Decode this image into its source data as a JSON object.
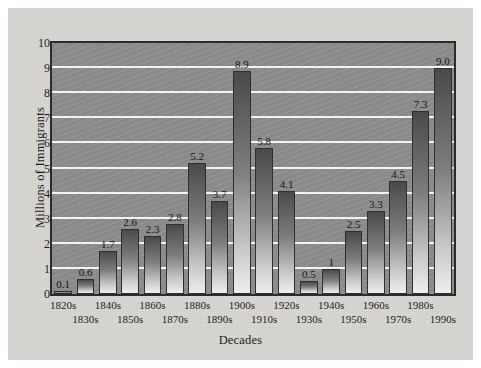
{
  "chart_data": {
    "type": "bar",
    "title": "",
    "xlabel": "Decades",
    "ylabel": "Millions of Immigrants",
    "ylim": [
      0,
      10
    ],
    "yticks": [
      0,
      1,
      2,
      3,
      4,
      5,
      6,
      7,
      8,
      9,
      10
    ],
    "ytick_labels": [
      "0",
      "1",
      "2",
      "3",
      "4",
      "5",
      "6",
      "7",
      "8",
      "9",
      "10"
    ],
    "grid": "horizontal",
    "legend": "none",
    "categories": [
      "1820s",
      "1830s",
      "1840s",
      "1850s",
      "1860s",
      "1870s",
      "1880s",
      "1890s",
      "1900s",
      "1910s",
      "1920s",
      "1930s",
      "1940s",
      "1950s",
      "1960s",
      "1970s",
      "1980s",
      "1990s"
    ],
    "values": [
      0.1,
      0.6,
      1.7,
      2.6,
      2.3,
      2.8,
      5.2,
      3.7,
      8.9,
      5.8,
      4.1,
      0.5,
      1.0,
      2.5,
      3.3,
      4.5,
      7.3,
      9.0
    ],
    "data_labels": [
      "0.1",
      "0.6",
      "1.7",
      "2.6",
      "2.3",
      "2.8",
      "5.2",
      "3.7",
      "8.9",
      "5.8",
      "4.1",
      "0.5",
      "1",
      "2.5",
      "3.3",
      "4.5",
      "7.3",
      "9.0"
    ],
    "bar_color": "#6e6e6e",
    "plot_background": "#8b8b8b",
    "gridline_color": "#f3f3f3",
    "figure_background": "#d9d7d3",
    "axis_color": "#2b2b2b"
  }
}
